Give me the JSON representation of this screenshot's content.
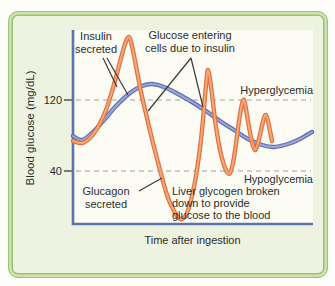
{
  "colors": {
    "page_background": "#fdfdfa",
    "frame_fill": "#edf3e0",
    "frame_border_dark": "#98c277",
    "frame_border_light": "#cfe3ac",
    "plot_background": "#fcfcf5",
    "axis_blue": "#5b74ae",
    "gridline_gray": "#9aa09e",
    "annotation_line": "#3a3a3a",
    "text": "#2d2d2d",
    "blue_curve_dark": "#5f6db3",
    "blue_curve_light": "#9aa8d8",
    "orange_curve_dark": "#e2713c",
    "orange_curve_light": "#f5a87a"
  },
  "labels": {
    "insulin": [
      "Insulin",
      "secreted"
    ],
    "glucose_entering": [
      "Glucose entering",
      "cells due to insulin"
    ],
    "hyperglycemia": "Hyperglycemia",
    "hypoglycemia": "Hypoglycemia",
    "glucagon": [
      "Glucagon",
      "secreted"
    ],
    "liver": [
      "Liver glycogen broken",
      "down to provide",
      "glucose to the blood"
    ],
    "xlabel": "Time after ingestion",
    "ylabel": "Blood glucose (mg/dL)",
    "tick_120": "120",
    "tick_40": "40"
  },
  "chart_data": {
    "type": "line",
    "title": "",
    "xlabel": "Time after ingestion",
    "ylabel": "Blood glucose (mg/dL)",
    "yticks": [
      40,
      120
    ],
    "grid": "dashed horizontal lines at y=40 and y=120 mg/dL",
    "legend_position": "none",
    "annotations": [
      "Insulin secreted",
      "Glucose entering cells due to insulin",
      "Hyperglycemia",
      "Hypoglycemia",
      "Glucagon secreted",
      "Liver glycogen broken down to provide glucose to the blood"
    ],
    "plot_px": {
      "left": 73,
      "top": 30,
      "right": 313,
      "bottom": 224
    },
    "y_calibration_px": {
      "value_120_at_y": 100,
      "value_40_at_y": 171
    },
    "gridlines": [
      {
        "value": 120,
        "y_px": 100
      },
      {
        "value": 40,
        "y_px": 171
      }
    ],
    "key_values_mgdl": {
      "blue_curve": {
        "start": 80,
        "broad_peak": 138,
        "late_minimum": 67,
        "end": 85
      },
      "orange_curve": {
        "first_peak": 190,
        "deep_trough": -14,
        "second_peak": 154,
        "third_peak": 118,
        "fourth_peak": 101,
        "troughs_between": [
          39,
          64
        ],
        "end": 73
      }
    },
    "series": [
      {
        "id": "blue-curve",
        "description": "smooth regulated blood glucose curve (blue)",
        "color_dark": "#5f6db3",
        "color_light": "#9aa8d8",
        "points_px": [
          [
            73,
            136
          ],
          [
            82,
            140
          ],
          [
            92,
            133
          ],
          [
            104,
            120
          ],
          [
            116,
            106
          ],
          [
            130,
            93
          ],
          [
            142,
            86
          ],
          [
            152,
            84
          ],
          [
            164,
            87
          ],
          [
            178,
            94
          ],
          [
            192,
            102
          ],
          [
            206,
            111
          ],
          [
            220,
            121
          ],
          [
            234,
            130
          ],
          [
            248,
            139
          ],
          [
            262,
            145
          ],
          [
            274,
            147
          ],
          [
            288,
            144
          ],
          [
            300,
            139
          ],
          [
            312,
            132
          ]
        ]
      },
      {
        "id": "orange-curve",
        "description": "oscillating blood glucose swings curve (orange)",
        "color_dark": "#e2713c",
        "color_light": "#f5a87a",
        "points_px": [
          [
            73,
            141
          ],
          [
            82,
            143
          ],
          [
            90,
            138
          ],
          [
            98,
            127
          ],
          [
            106,
            110
          ],
          [
            113,
            88
          ],
          [
            120,
            62
          ],
          [
            125,
            44
          ],
          [
            129,
            37
          ],
          [
            132,
            46
          ],
          [
            136,
            66
          ],
          [
            141,
            92
          ],
          [
            147,
            118
          ],
          [
            153,
            143
          ],
          [
            160,
            170
          ],
          [
            167,
            195
          ],
          [
            174,
            211
          ],
          [
            180,
            219
          ],
          [
            186,
            215
          ],
          [
            191,
            200
          ],
          [
            196,
            176
          ],
          [
            200,
            148
          ],
          [
            203,
            120
          ],
          [
            205,
            96
          ],
          [
            207,
            76
          ],
          [
            208,
            70
          ],
          [
            210,
            79
          ],
          [
            213,
            103
          ],
          [
            216,
            127
          ],
          [
            220,
            150
          ],
          [
            224,
            165
          ],
          [
            227,
            172
          ],
          [
            230,
            173
          ],
          [
            233,
            163
          ],
          [
            236,
            144
          ],
          [
            239,
            121
          ],
          [
            242,
            104
          ],
          [
            244,
            100
          ],
          [
            246,
            109
          ],
          [
            249,
            127
          ],
          [
            252,
            142
          ],
          [
            255,
            150
          ],
          [
            258,
            143
          ],
          [
            261,
            130
          ],
          [
            264,
            118
          ],
          [
            266,
            115
          ],
          [
            268,
            121
          ],
          [
            270,
            131
          ],
          [
            272,
            141
          ]
        ]
      }
    ],
    "annotation_lines_px": [
      {
        "name": "insulin-leader-to-orange",
        "pts": [
          103,
          58,
          117,
          87
        ]
      },
      {
        "name": "insulin-leader-to-blue",
        "pts": [
          107,
          58,
          128,
          95
        ]
      },
      {
        "name": "glucose-entering-leader-left",
        "pts": [
          191,
          58,
          148,
          111
        ]
      },
      {
        "name": "glucose-entering-leader-right",
        "pts": [
          191,
          58,
          203,
          107
        ]
      },
      {
        "name": "glucagon-leader",
        "pts": [
          139,
          191,
          162,
          178
        ]
      }
    ]
  }
}
